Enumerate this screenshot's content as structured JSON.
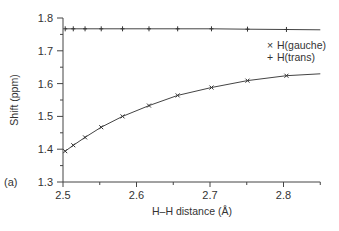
{
  "chart_data": {
    "type": "line",
    "title": "",
    "panel_label": "(a)",
    "xlabel": "H–H distance (Å)",
    "ylabel": "Shift (ppm)",
    "xlim": [
      2.5,
      2.85
    ],
    "ylim": [
      1.3,
      1.8
    ],
    "xticks": [
      2.5,
      2.6,
      2.7,
      2.8
    ],
    "xtick_labels": [
      "2.5",
      "2.6",
      "2.7",
      "2.8"
    ],
    "xminor_ticks": [
      2.55,
      2.65,
      2.75,
      2.85
    ],
    "yticks": [
      1.3,
      1.4,
      1.5,
      1.6,
      1.7,
      1.8
    ],
    "ytick_labels": [
      "1.3",
      "1.4",
      "1.5",
      "1.6",
      "1.7",
      "1.8"
    ],
    "yminor_ticks": [
      1.35,
      1.45,
      1.55,
      1.65,
      1.75
    ],
    "grid": false,
    "legend_position": "top-right",
    "series": [
      {
        "name": "H(gauche)",
        "marker": "x",
        "legend_symbol": "×",
        "x": [
          2.503,
          2.514,
          2.53,
          2.552,
          2.581,
          2.617,
          2.656,
          2.702,
          2.751,
          2.804
        ],
        "y": [
          1.394,
          1.412,
          1.436,
          1.467,
          1.5,
          1.533,
          1.564,
          1.588,
          1.609,
          1.624
        ],
        "line_end": [
          2.85,
          1.63
        ]
      },
      {
        "name": "H(trans)",
        "marker": "+",
        "legend_symbol": "+",
        "x": [
          2.503,
          2.514,
          2.53,
          2.552,
          2.581,
          2.617,
          2.656,
          2.702,
          2.751,
          2.804
        ],
        "y": [
          1.767,
          1.767,
          1.767,
          1.767,
          1.767,
          1.767,
          1.767,
          1.767,
          1.766,
          1.765
        ],
        "line_end": [
          2.85,
          1.764
        ]
      }
    ]
  }
}
